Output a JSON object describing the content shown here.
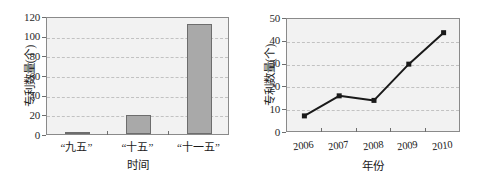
{
  "figure": {
    "panel_count": 2,
    "background_color": "#ffffff",
    "plot_background_color": "#f2f2f2",
    "grid_color": "#c2c2c2",
    "bar_fill_color": "#a9a9a9",
    "bar_edge_color": "#6d6d6d",
    "line_color": "#1a1a1a",
    "marker_color": "#1a1a1a"
  },
  "chart_data": [
    {
      "type": "bar",
      "title": "",
      "xlabel": "时间",
      "ylabel": "专利数量(个)",
      "categories": [
        "“九五”",
        "“十五”",
        "“十一五”"
      ],
      "values": [
        2,
        19,
        112
      ],
      "ylim": [
        0,
        120
      ],
      "yticks": [
        0,
        20,
        40,
        60,
        80,
        100,
        120
      ],
      "ytick_labels": [
        "0",
        "20",
        "40",
        "60",
        "80",
        "100",
        "120"
      ],
      "grid": true,
      "grid_axis": "y",
      "legend": false,
      "legend_position": "none",
      "series": [
        {
          "name": "专利数量",
          "values": [
            2,
            19,
            112
          ]
        }
      ]
    },
    {
      "type": "line",
      "title": "",
      "xlabel": "年份",
      "ylabel": "专利数量(个)",
      "x": [
        "2006",
        "2007",
        "2008",
        "2009",
        "2010"
      ],
      "categories": [
        "2006",
        "2007",
        "2008",
        "2009",
        "2010"
      ],
      "values": [
        7.5,
        16.3,
        14.3,
        30.2,
        44
      ],
      "ylim": [
        0,
        50
      ],
      "yticks": [
        0,
        10,
        20,
        30,
        40,
        50
      ],
      "ytick_labels": [
        "0",
        "10",
        "20",
        "30",
        "40",
        "50"
      ],
      "grid": true,
      "grid_axis": "y",
      "marker": "square",
      "legend": false,
      "legend_position": "none",
      "series": [
        {
          "name": "专利数量",
          "values": [
            7.5,
            16.3,
            14.3,
            30.2,
            44
          ]
        }
      ]
    }
  ]
}
